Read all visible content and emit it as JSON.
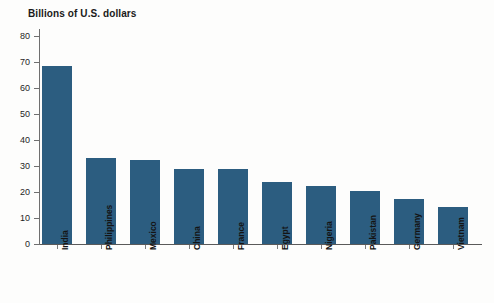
{
  "chart_data": {
    "type": "bar",
    "title": "Billions of U.S. dollars",
    "subtitle": "",
    "xlabel": "",
    "ylabel": "",
    "ylim": [
      0,
      80
    ],
    "ytick_labels": [
      "0",
      "10",
      "20",
      "30",
      "40",
      "50",
      "60",
      "70",
      "80"
    ],
    "ytick_values": [
      0,
      10,
      20,
      30,
      40,
      50,
      60,
      70,
      80
    ],
    "grid": false,
    "legend": false,
    "bar_color": "#2c5d80",
    "categories": [
      "India",
      "Philippines",
      "Mexico",
      "China",
      "France",
      "Egypt",
      "Nigeria",
      "Pakistan",
      "Germany",
      "Vietnam"
    ],
    "values": [
      68.5,
      33.0,
      32.5,
      28.8,
      29.0,
      24.0,
      22.3,
      20.2,
      17.4,
      14.2
    ]
  }
}
